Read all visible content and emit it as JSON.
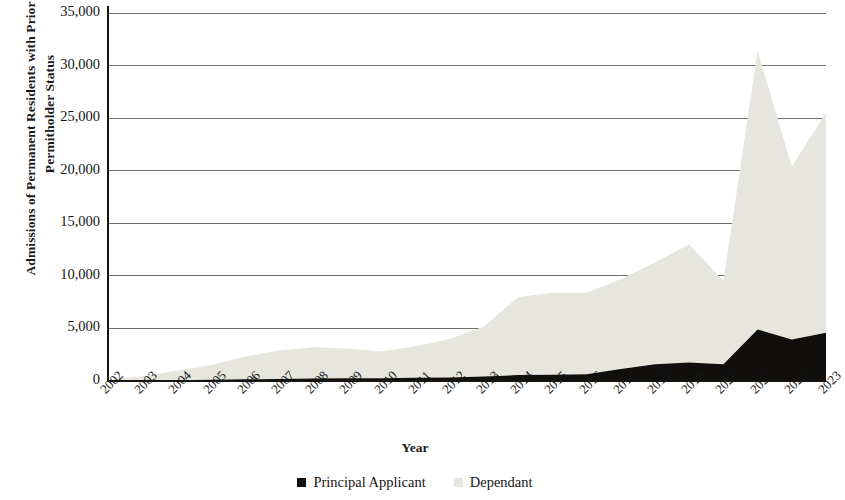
{
  "chart_data": {
    "type": "area",
    "stacked": true,
    "title": "",
    "xlabel": "Year",
    "ylabel": "Admissions of Permanent Residents with Prior Spousal Permitholder Status",
    "categories": [
      "2002",
      "2003",
      "2004",
      "2005",
      "2006",
      "2007",
      "2008",
      "2009",
      "2010",
      "2011",
      "2012",
      "2013",
      "2014",
      "2015",
      "2016",
      "2017",
      "2018",
      "2019",
      "2020",
      "2021",
      "2022",
      "2023"
    ],
    "series": [
      {
        "name": "Principal Applicant",
        "color": "#100f0d",
        "values": [
          20,
          40,
          70,
          110,
          160,
          200,
          240,
          250,
          260,
          300,
          340,
          420,
          560,
          600,
          640,
          1150,
          1600,
          1750,
          1600,
          4900,
          3950,
          4600
        ]
      },
      {
        "name": "Dependant",
        "color": "#e6e6df",
        "values": [
          80,
          400,
          900,
          1400,
          2140,
          2700,
          2960,
          2850,
          2540,
          3000,
          3660,
          4780,
          7440,
          7800,
          7760,
          8550,
          9700,
          11250,
          7900,
          26500,
          16450,
          20900
        ]
      }
    ],
    "totals": [
      100,
      440,
      970,
      1510,
      2300,
      2900,
      3200,
      3100,
      2800,
      3300,
      4000,
      5200,
      8000,
      8400,
      8400,
      9700,
      11300,
      13000,
      9500,
      31400,
      20400,
      25500
    ],
    "ylim": [
      0,
      35000
    ],
    "ytick_values": [
      0,
      5000,
      10000,
      15000,
      20000,
      25000,
      30000,
      35000
    ],
    "ytick_labels": [
      "0",
      "5,000",
      "10,000",
      "15,000",
      "20,000",
      "25,000",
      "30,000",
      "35,000"
    ],
    "grid": "horizontal",
    "grid_color": "#6f6f6a",
    "legend_position": "bottom",
    "legend": [
      {
        "label": "Principal Applicant",
        "color": "#100f0d"
      },
      {
        "label": "Dependant",
        "color": "#e6e6df"
      }
    ],
    "axis_line_color": "#15140f",
    "plot_background": "#ffffff"
  }
}
